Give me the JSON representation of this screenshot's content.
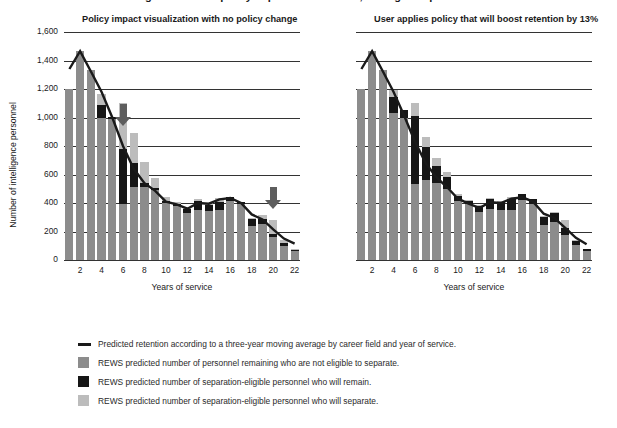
{
  "top_title_partial": "Figure 3. REWS policy impact visualization, intelligence personnel",
  "panels": [
    {
      "id": "left",
      "title": "Policy impact visualization with no policy change"
    },
    {
      "id": "right",
      "title": "User applies policy that will boost retention by 13%"
    }
  ],
  "axes": {
    "ylabel": "Number of intelligence personnel",
    "xlabel": "Years of service",
    "yticks": [
      "1,600",
      "1,400",
      "1,200",
      "1,000",
      "800",
      "600",
      "400",
      "200",
      "0"
    ],
    "xticks": [
      "2",
      "4",
      "6",
      "8",
      "10",
      "12",
      "14",
      "16",
      "18",
      "20",
      "22"
    ]
  },
  "legend": {
    "items": [
      {
        "swatch": "line",
        "color": "#1a1a1a",
        "label": "Predicted retention according to a three-year moving average by career field and year of service."
      },
      {
        "swatch": "square",
        "color": "#8c8c8c",
        "label": "REWS predicted number of personnel remaining who are not eligible to separate."
      },
      {
        "swatch": "square",
        "color": "#161616",
        "label": "REWS predicted number of separation-eligible personnel who will remain."
      },
      {
        "swatch": "square",
        "color": "#bcbcbc",
        "label": "REWS predicted number of separation-eligible personnel who will separate."
      }
    ]
  },
  "annotations": [
    {
      "type": "down-arrow",
      "panel": "left",
      "x_year": 6,
      "color": "#5e5e5e"
    },
    {
      "type": "down-arrow",
      "panel": "left",
      "x_year": 20,
      "color": "#5e5e5e"
    }
  ],
  "chart_data": [
    {
      "type": "bar",
      "id": "left",
      "title": "Policy impact visualization with no policy change",
      "xlabel": "Years of service",
      "ylabel": "Number of intelligence personnel",
      "ylim": [
        0,
        1600
      ],
      "ytick_step": 200,
      "grid": true,
      "stacked": true,
      "legend_position": "below-figure",
      "categories": [
        1,
        2,
        3,
        4,
        5,
        6,
        7,
        8,
        9,
        10,
        11,
        12,
        13,
        14,
        15,
        16,
        17,
        18,
        19,
        20,
        21,
        22
      ],
      "series": [
        {
          "name": "REWS predicted number of personnel remaining who are not eligible to separate.",
          "color": "#8c8c8c",
          "values": [
            1200,
            1470,
            1330,
            1000,
            990,
            390,
            510,
            510,
            490,
            400,
            380,
            330,
            350,
            345,
            350,
            415,
            390,
            240,
            250,
            165,
            100,
            60
          ]
        },
        {
          "name": "REWS predicted number of separation-eligible personnel who will remain.",
          "color": "#161616",
          "values": [
            0,
            0,
            0,
            85,
            15,
            390,
            170,
            30,
            15,
            15,
            15,
            30,
            65,
            40,
            60,
            30,
            15,
            45,
            40,
            20,
            20,
            10
          ]
        },
        {
          "name": "REWS predicted number of separation-eligible personnel who will separate.",
          "color": "#bcbcbc",
          "values": [
            0,
            0,
            0,
            80,
            0,
            325,
            210,
            150,
            70,
            25,
            10,
            15,
            10,
            15,
            25,
            0,
            0,
            10,
            25,
            95,
            20,
            5
          ]
        }
      ],
      "line_series": {
        "name": "Predicted retention according to a three-year moving average by career field and year of service.",
        "color": "#1a1a1a",
        "values": [
          1340,
          1465,
          1325,
          1180,
          1000,
          800,
          640,
          540,
          485,
          410,
          390,
          360,
          400,
          395,
          425,
          435,
          400,
          320,
          285,
          215,
          150,
          115
        ]
      }
    },
    {
      "type": "bar",
      "id": "right",
      "title": "User applies policy that will boost retention by 13%",
      "xlabel": "Years of service",
      "ylabel": "Number of intelligence personnel",
      "ylim": [
        0,
        1600
      ],
      "ytick_step": 200,
      "grid": true,
      "stacked": true,
      "legend_position": "below-figure",
      "categories": [
        1,
        2,
        3,
        4,
        5,
        6,
        7,
        8,
        9,
        10,
        11,
        12,
        13,
        14,
        15,
        16,
        17,
        18,
        19,
        20,
        21,
        22
      ],
      "series": [
        {
          "name": "REWS predicted number of personnel remaining who are not eligible to separate.",
          "color": "#8c8c8c",
          "values": [
            1200,
            1470,
            1330,
            1035,
            1000,
            530,
            565,
            540,
            500,
            415,
            390,
            335,
            355,
            350,
            350,
            420,
            395,
            245,
            265,
            175,
            105,
            60
          ]
        },
        {
          "name": "REWS predicted number of separation-eligible personnel who will remain.",
          "color": "#161616",
          "values": [
            0,
            0,
            0,
            110,
            50,
            480,
            230,
            120,
            80,
            35,
            25,
            45,
            75,
            60,
            80,
            45,
            35,
            60,
            65,
            50,
            25,
            15
          ]
        },
        {
          "name": "REWS predicted number of separation-eligible personnel who will separate.",
          "color": "#bcbcbc",
          "values": [
            0,
            0,
            0,
            45,
            0,
            90,
            70,
            55,
            35,
            10,
            5,
            5,
            5,
            5,
            10,
            0,
            0,
            5,
            10,
            55,
            10,
            5
          ]
        }
      ],
      "line_series": {
        "name": "Predicted retention according to a three-year moving average by career field and year of service.",
        "color": "#1a1a1a",
        "values": [
          1340,
          1465,
          1325,
          1180,
          1010,
          830,
          680,
          580,
          510,
          430,
          395,
          365,
          405,
          400,
          430,
          440,
          410,
          325,
          295,
          225,
          155,
          110
        ]
      }
    }
  ]
}
